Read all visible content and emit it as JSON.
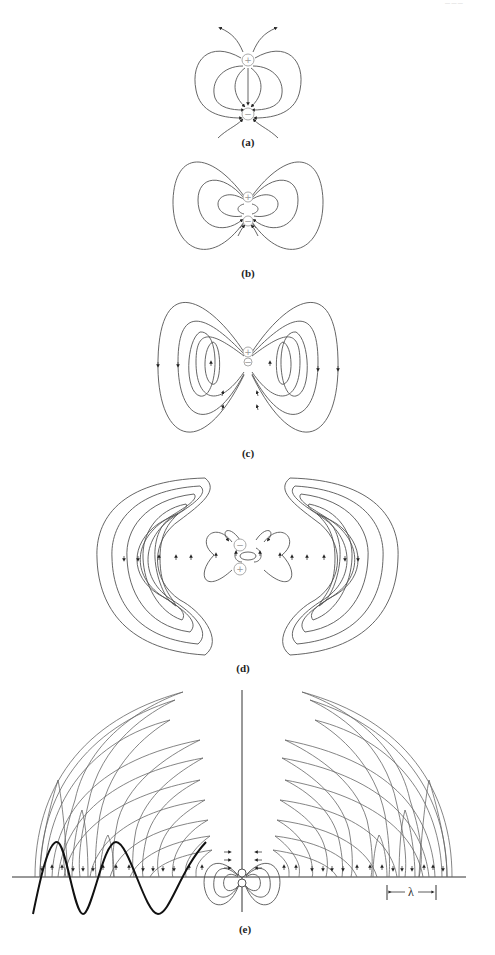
{
  "figure": {
    "panels": [
      {
        "id": "a",
        "label": "(a)",
        "charges": {
          "top": "+",
          "bottom": "−"
        }
      },
      {
        "id": "b",
        "label": "(b)",
        "charges": {
          "top": "+",
          "bottom": "−"
        }
      },
      {
        "id": "c",
        "label": "(c)",
        "charges": {
          "top": "+",
          "bottom": "−"
        }
      },
      {
        "id": "d",
        "label": "(d)",
        "charges": {
          "top": "−",
          "bottom": "+"
        }
      },
      {
        "id": "e",
        "label": "(e)",
        "wavelength_symbol": "λ"
      }
    ],
    "corner_mark": "— — —",
    "colors": {
      "field_lines": "#555555",
      "wave": "#111111",
      "charges": "#aaaaaa",
      "background": "#ffffff"
    }
  }
}
